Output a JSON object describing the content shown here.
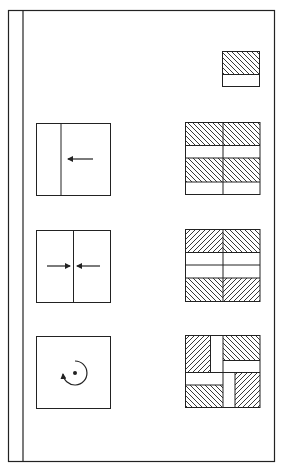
{
  "diagram": {
    "title": "",
    "legend_tile": {
      "description": "unit tile: hatched upper part, blank lower strip",
      "hatch_direction": "backslash"
    },
    "rows": [
      {
        "id": "translation",
        "operation": "shift left (translation)",
        "icon": "left-arrow-icon",
        "result": "2x2 tiling, all tiles identical, hatch backslash"
      },
      {
        "id": "mirror",
        "operation": "two halves pushed toward center (reflection)",
        "icon": "converging-arrows-icon",
        "result": "2x2 tiling, left/right mirrored, top/bottom mirrored"
      },
      {
        "id": "rotation",
        "operation": "rotation about center point",
        "icon": "rotation-arrow-icon",
        "result": "2x2 pinwheel tiling, tiles rotated 90 degrees"
      }
    ],
    "colors": {
      "stroke": "#222222",
      "background": "#ffffff"
    }
  }
}
